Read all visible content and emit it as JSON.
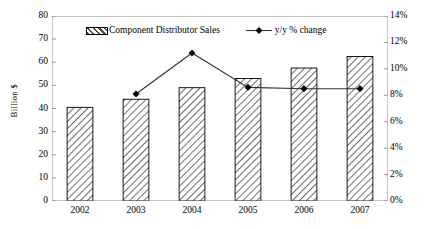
{
  "chart_data": {
    "type": "bar",
    "title": "",
    "subtitle": "",
    "xlabel": "",
    "ylabel": "Billion $",
    "y2label": "",
    "categories": [
      "2002",
      "2003",
      "2004",
      "2005",
      "2006",
      "2007"
    ],
    "ylim": [
      0,
      80
    ],
    "ytick_step": 10,
    "yticks": [
      "0",
      "10",
      "20",
      "30",
      "40",
      "50",
      "60",
      "70",
      "80"
    ],
    "y2lim": [
      0,
      14
    ],
    "y2tick_step": 2,
    "y2ticks": [
      "0%",
      "2%",
      "4%",
      "6%",
      "8%",
      "10%",
      "12%",
      "14%"
    ],
    "grid": false,
    "legend_position": "top-inside",
    "series": [
      {
        "name": "Component Distributor Sales",
        "type": "bar",
        "axis": "left",
        "unit": "Billion $",
        "fill": "diagonal-hatch",
        "values": [
          40.5,
          44.0,
          49.0,
          53.0,
          57.5,
          62.5
        ]
      },
      {
        "name": "y/y % change",
        "type": "line",
        "axis": "right",
        "unit": "%",
        "marker": "diamond",
        "values": [
          null,
          8.1,
          11.2,
          8.6,
          8.5,
          8.5
        ]
      }
    ]
  },
  "legend": {
    "bar_label": "Component Distributor Sales",
    "line_label": "y/y % change"
  },
  "colors": {
    "axis": "#808080",
    "bar_outline": "#000000",
    "bar_hatch": "#555555",
    "line": "#333333",
    "marker": "#000000",
    "background": "#ffffff",
    "text": "#000000"
  }
}
